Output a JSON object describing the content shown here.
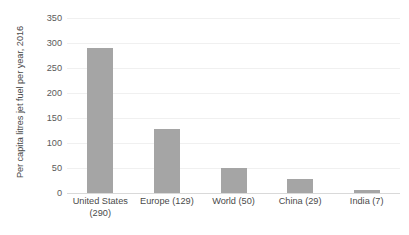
{
  "chart_data": {
    "type": "bar",
    "title": "",
    "xlabel": "",
    "ylabel": "Per capita litres jet fuel per year, 2016",
    "categories": [
      "United States (290)",
      "Europe (129)",
      "World (50)",
      "China (29)",
      "India (7)"
    ],
    "category_lines": [
      [
        "United States",
        "(290)"
      ],
      [
        "Europe (129)"
      ],
      [
        "World (50)"
      ],
      [
        "China (29)"
      ],
      [
        "India (7)"
      ]
    ],
    "values": [
      290,
      129,
      50,
      29,
      7
    ],
    "ylim": [
      0,
      350
    ],
    "yticks": [
      0,
      50,
      100,
      150,
      200,
      250,
      300,
      350
    ],
    "ytick_labels": [
      "0",
      "50",
      "100",
      "150",
      "200",
      "250",
      "300",
      "350"
    ],
    "grid": true,
    "grid_axis": "y",
    "legend": false,
    "bar_color": "#a5a5a5",
    "gridline_color": "#f0f0f0",
    "axis_color": "#d9d9d9",
    "background_color": "#ffffff",
    "text_color": "#4a4a4a"
  }
}
